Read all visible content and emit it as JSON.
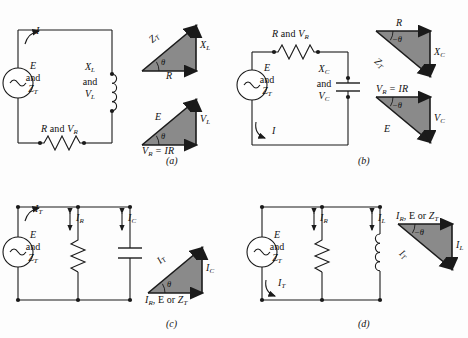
{
  "figure": {
    "colors": {
      "line": "#1a1a1a",
      "triangle_fill": "#8a8a8a",
      "triangle_stroke": "#1a1a1a",
      "background": "#fdfdfd",
      "text": "#111111"
    },
    "panels": [
      {
        "tag": "(a)",
        "type": "series-RL",
        "circuit": {
          "source_label_lines": [
            "E",
            "and",
            "Z_T"
          ],
          "source_symbol": "ac-sine",
          "current_label": "I",
          "series_elements": [
            {
              "name": "inductor",
              "label_lines": [
                "X_L",
                "and",
                "V_L"
              ]
            },
            {
              "name": "resistor",
              "label": "R and V_R"
            }
          ]
        },
        "triangles": [
          {
            "name": "impedance-triangle",
            "hypotenuse": "Z_T",
            "vertical": "X_L",
            "horizontal": "R",
            "angle": "θ",
            "orientation": "up"
          },
          {
            "name": "voltage-triangle",
            "hypotenuse": "E",
            "vertical": "V_L",
            "horizontal": "V_R = IR",
            "angle": "θ",
            "orientation": "up"
          }
        ]
      },
      {
        "tag": "(b)",
        "type": "series-RC",
        "circuit": {
          "source_label_lines": [
            "E",
            "and",
            "Z_T"
          ],
          "source_symbol": "ac-sine",
          "current_label": "I",
          "series_elements": [
            {
              "name": "resistor",
              "label": "R and V_R"
            },
            {
              "name": "capacitor",
              "label_lines": [
                "X_C",
                "and",
                "V_C"
              ]
            }
          ]
        },
        "triangles": [
          {
            "name": "impedance-triangle",
            "hypotenuse": "Z_T",
            "vertical": "X_C",
            "horizontal": "R",
            "angle": "−θ",
            "orientation": "down"
          },
          {
            "name": "voltage-triangle",
            "hypotenuse": "E",
            "vertical": "V_C",
            "horizontal": "V_R = IR",
            "angle": "−θ",
            "orientation": "down"
          }
        ]
      },
      {
        "tag": "(c)",
        "type": "parallel-RC",
        "circuit": {
          "source_label_lines": [
            "E",
            "and",
            "Z_T"
          ],
          "source_symbol": "ac-sine",
          "current_label": "I_T",
          "branches": [
            {
              "name": "resistor",
              "current_label": "I_R"
            },
            {
              "name": "capacitor",
              "current_label": "I_C"
            }
          ]
        },
        "triangles": [
          {
            "name": "current-triangle",
            "hypotenuse": "I_T",
            "vertical": "I_C",
            "horizontal": "I_R, E or Z_T",
            "angle": "θ",
            "orientation": "up"
          }
        ]
      },
      {
        "tag": "(d)",
        "type": "parallel-RL",
        "circuit": {
          "source_label_lines": [
            "E",
            "and",
            "Z_T"
          ],
          "source_symbol": "ac-sine",
          "current_label": "I_T",
          "branches": [
            {
              "name": "resistor",
              "current_label": "I_R"
            },
            {
              "name": "inductor",
              "current_label": "I_L"
            }
          ]
        },
        "triangles": [
          {
            "name": "current-triangle",
            "hypotenuse": "I_T",
            "vertical": "I_L",
            "horizontal": "I_R, E or Z_T",
            "angle": "−θ",
            "orientation": "down"
          }
        ]
      }
    ],
    "labels": {
      "a": {
        "current": "I",
        "source": {
          "l1": "E",
          "l2": "and",
          "l3": "Z",
          "l3sub": "T"
        },
        "inductor": {
          "l1": "X",
          "l1sub": "L",
          "l2": "and",
          "l3": "V",
          "l3sub": "L"
        },
        "resistor_pre": "R",
        "resistor_and": " and ",
        "resistor_v": "V",
        "resistor_vsub": "R",
        "tri1_hyp": "Z",
        "tri1_hyp_sub": "T",
        "tri1_vert": "X",
        "tri1_vert_sub": "L",
        "tri1_horz": "R",
        "tri1_angle": "θ",
        "tri2_hyp": "E",
        "tri2_vert": "V",
        "tri2_vert_sub": "L",
        "tri2_horz_v": "V",
        "tri2_horz_vsub": "R",
        "tri2_horz_rest": " = IR",
        "tri2_angle": "θ",
        "tag": "(a)"
      },
      "b": {
        "current": "I",
        "source": {
          "l1": "E",
          "l2": "and",
          "l3": "Z",
          "l3sub": "T"
        },
        "capacitor": {
          "l1": "X",
          "l1sub": "C",
          "l2": "and",
          "l3": "V",
          "l3sub": "C"
        },
        "resistor_pre": "R",
        "resistor_and": " and ",
        "resistor_v": "V",
        "resistor_vsub": "R",
        "tri1_hyp": "Z",
        "tri1_hyp_sub": "T",
        "tri1_vert": "X",
        "tri1_vert_sub": "C",
        "tri1_horz": "R",
        "tri1_angle": "−θ",
        "tri2_hyp": "E",
        "tri2_vert": "V",
        "tri2_vert_sub": "C",
        "tri2_horz_v": "V",
        "tri2_horz_vsub": "R",
        "tri2_horz_rest": " = IR",
        "tri2_angle": "−θ",
        "tag": "(b)"
      },
      "c": {
        "current_total": "I",
        "current_total_sub": "T",
        "source": {
          "l1": "E",
          "l2": "and",
          "l3": "Z",
          "l3sub": "T"
        },
        "branch_r": "I",
        "branch_r_sub": "R",
        "branch_c": "I",
        "branch_c_sub": "C",
        "tri_hyp": "I",
        "tri_hyp_sub": "T",
        "tri_vert": "I",
        "tri_vert_sub": "C",
        "tri_horz_1": "I",
        "tri_horz_1sub": "R",
        "tri_horz_mid": ", E or ",
        "tri_horz_2": "Z",
        "tri_horz_2sub": "T",
        "tri_angle": "θ",
        "tag": "(c)"
      },
      "d": {
        "current_total": "I",
        "current_total_sub": "T",
        "source": {
          "l1": "E",
          "l2": "and",
          "l3": "Z",
          "l3sub": "T"
        },
        "branch_r": "I",
        "branch_r_sub": "R",
        "branch_l": "I",
        "branch_l_sub": "L",
        "tri_hyp": "I",
        "tri_hyp_sub": "T",
        "tri_vert": "I",
        "tri_vert_sub": "L",
        "tri_horz_1": "I",
        "tri_horz_1sub": "R",
        "tri_horz_mid": ", E or ",
        "tri_horz_2": "Z",
        "tri_horz_2sub": "T",
        "tri_angle": "−θ",
        "tag": "(d)"
      }
    }
  }
}
